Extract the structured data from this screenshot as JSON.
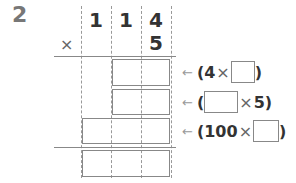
{
  "question": {
    "number": "2"
  },
  "problem": {
    "multiplicand_digits": [
      "1",
      "1",
      "4"
    ],
    "multiplier_digit": "5",
    "operator": "×"
  },
  "partial_products": [
    {
      "arrow": "←",
      "open": "(",
      "left": "4",
      "op": "×",
      "right": "",
      "close": ")"
    },
    {
      "arrow": "←",
      "open": "(",
      "left": "",
      "op": "×",
      "right": "5",
      "close": ")"
    },
    {
      "arrow": "←",
      "open": "(",
      "left": "100",
      "op": "×",
      "right": "",
      "close": ")"
    }
  ]
}
